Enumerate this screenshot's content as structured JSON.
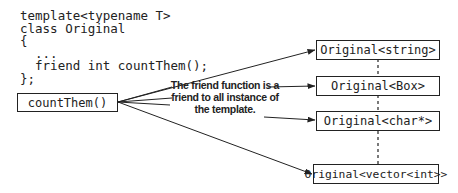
{
  "diagram": {
    "code": {
      "lines": [
        "template<typename T>",
        "class Original",
        "{",
        "  ...",
        "  friend int countThem();",
        "};"
      ]
    },
    "function_box": {
      "label": "countThem()"
    },
    "annotation": {
      "lines": [
        "The friend function is a",
        "friend to all instance of",
        "the template."
      ]
    },
    "instances": [
      {
        "label": "Original<string>"
      },
      {
        "label": "Original<Box>"
      },
      {
        "label": "Original<char*>"
      },
      {
        "label": "Original<vector<int>>"
      }
    ],
    "colors": {
      "stroke": "#222222",
      "background": "#ffffff"
    }
  }
}
